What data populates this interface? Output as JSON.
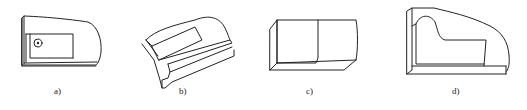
{
  "figure": {
    "panels": [
      {
        "id": "a",
        "label": "a)",
        "description": "block with through slot and circular hole mark"
      },
      {
        "id": "b",
        "label": "b)",
        "description": "block with stepped L-shaped slot, oblique view"
      },
      {
        "id": "c",
        "label": "c)",
        "description": "block with rectangular open pocket"
      },
      {
        "id": "d",
        "label": "d)",
        "description": "block with curved-profile step"
      }
    ],
    "line_color": "#222222",
    "background": "#ffffff"
  }
}
